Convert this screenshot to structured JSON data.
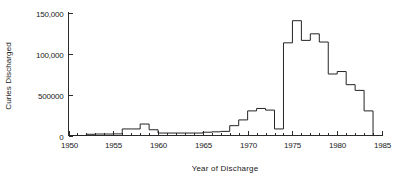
{
  "chart_data": {
    "type": "line",
    "subtype": "step-post",
    "title": "",
    "xlabel": "Year of Discharge",
    "ylabel": "Curies  Discharged",
    "xlim": [
      1950,
      1985
    ],
    "ylim": [
      0,
      150000
    ],
    "grid": false,
    "legend": null,
    "x_ticks_major": [
      1950,
      1955,
      1960,
      1965,
      1970,
      1975,
      1980,
      1985
    ],
    "x_tick_labels": [
      "1950",
      "1955",
      "1960",
      "1965",
      "1970",
      "1975",
      "1980",
      "1985"
    ],
    "x_minor_tick_step": 1,
    "y_ticks_major": [
      0,
      50000,
      100000,
      150000
    ],
    "y_tick_labels": [
      "0",
      "500000",
      "100,000",
      "150,000"
    ],
    "series": [
      {
        "name": "Curies Discharged",
        "color": "#242424",
        "x": [
          1950,
          1951,
          1952,
          1953,
          1954,
          1955,
          1956,
          1957,
          1958,
          1959,
          1960,
          1961,
          1962,
          1963,
          1964,
          1965,
          1966,
          1967,
          1968,
          1969,
          1970,
          1971,
          1972,
          1973,
          1974,
          1975,
          1976,
          1977,
          1978,
          1979,
          1980,
          1981,
          1982,
          1983
        ],
        "values": [
          0,
          0,
          1500,
          1800,
          1800,
          2000,
          8000,
          8000,
          14000,
          7000,
          3000,
          3000,
          3000,
          3000,
          3000,
          4000,
          4500,
          5000,
          12000,
          19000,
          30000,
          33000,
          31000,
          8000,
          113000,
          140000,
          116000,
          124000,
          114000,
          75000,
          78000,
          62000,
          55000,
          30000
        ]
      }
    ],
    "annotations": []
  },
  "axis": {
    "y_title": "Curies  Discharged",
    "x_title": "Year of Discharge"
  },
  "colors": {
    "line": "#242424",
    "axis": "#2b2b2b",
    "text": "#1a1a1a",
    "background": "#ffffff"
  }
}
